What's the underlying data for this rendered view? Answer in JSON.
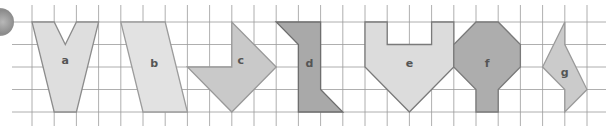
{
  "diagram": {
    "type": "grid-shapes",
    "grid": {
      "origin_x": 32,
      "origin_y": 22,
      "cell_w": 22.2,
      "cell_h": 22.5,
      "cols": 26,
      "rows": 4,
      "line_color": "#9a9a9a"
    },
    "badge": {
      "name": "exercise-number-badge"
    },
    "shapes": [
      {
        "label": "a",
        "fill": "#dedede",
        "stroke": "#8c8c8c",
        "points": [
          [
            0,
            0
          ],
          [
            1,
            0
          ],
          [
            1.5,
            1
          ],
          [
            2,
            0
          ],
          [
            3,
            0
          ],
          [
            2,
            4
          ],
          [
            1,
            4
          ]
        ],
        "label_pos": [
          1.5,
          1.7
        ]
      },
      {
        "label": "b",
        "fill": "#e2e2e2",
        "stroke": "#9c9c9c",
        "points": [
          [
            4,
            0
          ],
          [
            6,
            0
          ],
          [
            7,
            4
          ],
          [
            5,
            4
          ]
        ],
        "label_pos": [
          5.5,
          1.8
        ]
      },
      {
        "label": "c",
        "fill": "#c9c9c9",
        "stroke": "#999999",
        "points": [
          [
            7,
            2
          ],
          [
            9,
            2
          ],
          [
            9,
            0
          ],
          [
            11,
            2
          ],
          [
            9,
            4
          ]
        ],
        "label_pos": [
          9.4,
          1.7
        ]
      },
      {
        "label": "d",
        "fill": "#a9a9a9",
        "stroke": "#6e6e6e",
        "points": [
          [
            11,
            0
          ],
          [
            13,
            0
          ],
          [
            13,
            3
          ],
          [
            14,
            4
          ],
          [
            12,
            4
          ],
          [
            12,
            1
          ]
        ],
        "label_pos": [
          12.5,
          1.8
        ]
      },
      {
        "label": "e",
        "fill": "#dcdcdc",
        "stroke": "#7a7a7a",
        "points": [
          [
            15,
            0
          ],
          [
            16,
            0
          ],
          [
            16,
            1
          ],
          [
            18,
            1
          ],
          [
            18,
            0
          ],
          [
            19,
            0
          ],
          [
            19,
            2
          ],
          [
            17,
            4
          ],
          [
            15,
            2
          ]
        ],
        "label_pos": [
          17,
          1.8
        ]
      },
      {
        "label": "f",
        "fill": "#adadad",
        "stroke": "#7a7a7a",
        "points": [
          [
            20,
            0
          ],
          [
            21,
            0
          ],
          [
            22,
            1
          ],
          [
            22,
            2
          ],
          [
            21,
            3
          ],
          [
            21,
            4
          ],
          [
            20,
            4
          ],
          [
            20,
            3
          ],
          [
            19,
            2
          ],
          [
            19,
            1
          ]
        ],
        "label_pos": [
          20.5,
          1.8
        ]
      },
      {
        "label": "g",
        "fill": "#cbcbcb",
        "stroke": "#9a9a9a",
        "points": [
          [
            24,
            0
          ],
          [
            24,
            1
          ],
          [
            25,
            3
          ],
          [
            24,
            4
          ],
          [
            24,
            3
          ],
          [
            23,
            2
          ]
        ],
        "label_pos": [
          24,
          2.2
        ]
      }
    ]
  }
}
